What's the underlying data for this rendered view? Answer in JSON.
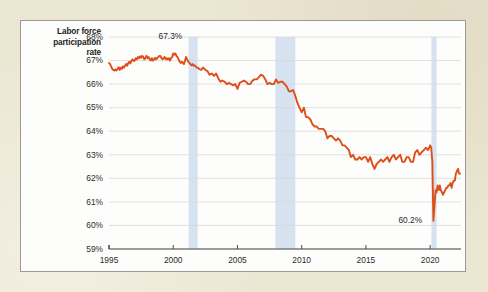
{
  "figure": {
    "background_color": "#ece7d3",
    "card_color": "#fdfdfb",
    "card_border_color": "#9a9a92",
    "line_color": "#dd4f1a",
    "recession_band_color": "#d6e2ef",
    "gridline_color": "#d9d9d9",
    "axis_color": "#4a4a4a"
  },
  "axis_title": {
    "line1": "Labor force",
    "line2": "participation",
    "line3": "rate"
  },
  "annotations": [
    {
      "id": "peak",
      "text": "67.3%",
      "year": 2000.1,
      "value": 67.3
    },
    {
      "id": "trough",
      "text": "60.2%",
      "year": 2020.33,
      "value": 60.2
    }
  ],
  "chart_data": {
    "type": "line",
    "title": "",
    "subtitle": "",
    "xlabel": "",
    "ylabel": "Labor force participation rate",
    "xlim": [
      1995,
      2022.4
    ],
    "ylim": [
      59,
      68
    ],
    "grid": true,
    "legend": null,
    "y_tick_labels": [
      "59%",
      "60%",
      "61%",
      "62%",
      "63%",
      "64%",
      "65%",
      "66%",
      "67%",
      "68%"
    ],
    "y_ticks": [
      59,
      60,
      61,
      62,
      63,
      64,
      65,
      66,
      67,
      68
    ],
    "x_tick_labels": [
      "1995",
      "2000",
      "2005",
      "2010",
      "2015",
      "2020"
    ],
    "x_ticks": [
      1995,
      2000,
      2005,
      2010,
      2015,
      2020
    ],
    "series": [
      {
        "name": "Labor force participation rate",
        "color": "#dd4f1a",
        "x": [
          1995.0,
          1995.08,
          1995.17,
          1995.25,
          1995.33,
          1995.42,
          1995.5,
          1995.58,
          1995.67,
          1995.75,
          1995.83,
          1995.92,
          1996.0,
          1996.08,
          1996.17,
          1996.25,
          1996.33,
          1996.42,
          1996.5,
          1996.58,
          1996.67,
          1996.75,
          1996.83,
          1996.92,
          1997.0,
          1997.08,
          1997.17,
          1997.25,
          1997.33,
          1997.42,
          1997.5,
          1997.58,
          1997.67,
          1997.75,
          1997.83,
          1997.92,
          1998.0,
          1998.08,
          1998.17,
          1998.25,
          1998.33,
          1998.42,
          1998.5,
          1998.58,
          1998.67,
          1998.75,
          1998.83,
          1998.92,
          1999.0,
          1999.08,
          1999.17,
          1999.25,
          1999.33,
          1999.42,
          1999.5,
          1999.58,
          1999.67,
          1999.75,
          1999.83,
          1999.92,
          2000.0,
          2000.08,
          2000.17,
          2000.25,
          2000.33,
          2000.42,
          2000.5,
          2000.58,
          2000.67,
          2000.75,
          2000.83,
          2000.92,
          2001.0,
          2001.08,
          2001.17,
          2001.25,
          2001.33,
          2001.42,
          2001.5,
          2001.58,
          2001.67,
          2001.75,
          2001.83,
          2001.92,
          2002.0,
          2002.17,
          2002.33,
          2002.5,
          2002.67,
          2002.83,
          2003.0,
          2003.17,
          2003.33,
          2003.5,
          2003.67,
          2003.83,
          2004.0,
          2004.17,
          2004.33,
          2004.5,
          2004.67,
          2004.83,
          2005.0,
          2005.17,
          2005.33,
          2005.5,
          2005.67,
          2005.83,
          2006.0,
          2006.17,
          2006.33,
          2006.5,
          2006.67,
          2006.83,
          2007.0,
          2007.17,
          2007.33,
          2007.5,
          2007.67,
          2007.83,
          2008.0,
          2008.17,
          2008.33,
          2008.5,
          2008.67,
          2008.83,
          2009.0,
          2009.17,
          2009.33,
          2009.5,
          2009.67,
          2009.83,
          2010.0,
          2010.17,
          2010.33,
          2010.5,
          2010.67,
          2010.83,
          2011.0,
          2011.17,
          2011.33,
          2011.5,
          2011.67,
          2011.83,
          2012.0,
          2012.17,
          2012.33,
          2012.5,
          2012.67,
          2012.83,
          2013.0,
          2013.17,
          2013.33,
          2013.5,
          2013.67,
          2013.83,
          2014.0,
          2014.17,
          2014.33,
          2014.5,
          2014.67,
          2014.83,
          2015.0,
          2015.17,
          2015.33,
          2015.5,
          2015.67,
          2015.83,
          2016.0,
          2016.17,
          2016.33,
          2016.5,
          2016.67,
          2016.83,
          2017.0,
          2017.17,
          2017.33,
          2017.5,
          2017.67,
          2017.83,
          2018.0,
          2018.17,
          2018.33,
          2018.5,
          2018.67,
          2018.83,
          2019.0,
          2019.17,
          2019.33,
          2019.5,
          2019.67,
          2019.83,
          2020.0,
          2020.08,
          2020.17,
          2020.25,
          2020.33,
          2020.42,
          2020.5,
          2020.58,
          2020.67,
          2020.75,
          2020.83,
          2020.92,
          2021.0,
          2021.08,
          2021.17,
          2021.25,
          2021.33,
          2021.42,
          2021.5,
          2021.58,
          2021.67,
          2021.75,
          2021.83,
          2021.92,
          2022.0,
          2022.08,
          2022.17,
          2022.25,
          2022.33
        ],
        "y": [
          66.9,
          66.85,
          66.75,
          66.65,
          66.6,
          66.58,
          66.62,
          66.58,
          66.65,
          66.72,
          66.6,
          66.7,
          66.65,
          66.75,
          66.7,
          66.78,
          66.85,
          66.78,
          66.9,
          66.95,
          66.88,
          67.0,
          67.05,
          66.98,
          67.0,
          67.1,
          67.05,
          67.15,
          67.1,
          67.18,
          67.12,
          67.2,
          67.15,
          67.05,
          67.1,
          67.2,
          67.1,
          67.15,
          67.05,
          67.0,
          67.1,
          67.0,
          67.05,
          67.12,
          67.05,
          67.1,
          67.15,
          67.2,
          67.2,
          67.1,
          67.05,
          67.1,
          67.15,
          67.05,
          67.1,
          67.05,
          67.1,
          67.0,
          67.1,
          67.15,
          67.3,
          67.25,
          67.3,
          67.2,
          67.15,
          67.05,
          66.95,
          66.9,
          66.95,
          66.9,
          66.85,
          67.0,
          67.15,
          67.05,
          66.95,
          66.9,
          66.85,
          66.8,
          66.85,
          66.78,
          66.8,
          66.75,
          66.7,
          66.7,
          66.65,
          66.6,
          66.7,
          66.6,
          66.55,
          66.4,
          66.45,
          66.35,
          66.45,
          66.25,
          66.1,
          66.15,
          66.1,
          66.0,
          66.05,
          66.0,
          65.95,
          66.0,
          65.8,
          66.05,
          66.1,
          66.15,
          66.1,
          66.0,
          66.0,
          66.15,
          66.2,
          66.2,
          66.3,
          66.4,
          66.35,
          66.2,
          66.0,
          66.05,
          66.0,
          66.0,
          66.2,
          66.05,
          66.1,
          66.1,
          66.0,
          65.9,
          65.7,
          65.7,
          65.75,
          65.5,
          65.2,
          65.0,
          64.8,
          65.0,
          64.6,
          64.6,
          64.5,
          64.3,
          64.2,
          64.2,
          64.1,
          64.1,
          64.1,
          64.0,
          63.7,
          63.8,
          63.8,
          63.7,
          63.6,
          63.7,
          63.6,
          63.4,
          63.4,
          63.3,
          63.2,
          62.9,
          63.0,
          62.8,
          62.8,
          62.9,
          62.8,
          62.9,
          62.9,
          62.7,
          62.9,
          62.6,
          62.4,
          62.6,
          62.7,
          62.8,
          62.7,
          62.8,
          62.9,
          62.7,
          62.9,
          63.0,
          62.8,
          62.9,
          63.0,
          62.7,
          62.7,
          62.9,
          62.9,
          62.7,
          62.7,
          63.1,
          63.2,
          63.0,
          63.1,
          63.2,
          63.3,
          63.2,
          63.4,
          63.3,
          62.7,
          60.2,
          60.8,
          61.5,
          61.4,
          61.7,
          61.5,
          61.7,
          61.5,
          61.4,
          61.3,
          61.4,
          61.5,
          61.6,
          61.6,
          61.7,
          61.7,
          61.8,
          61.6,
          61.8,
          61.9,
          61.9,
          62.2,
          62.3,
          62.4,
          62.2,
          62.2
        ]
      }
    ],
    "shaded_regions": [
      {
        "label": "2001 recession",
        "start": 2001.2,
        "end": 2001.9,
        "color": "#d6e2ef"
      },
      {
        "label": "Great Recession",
        "start": 2007.95,
        "end": 2009.5,
        "color": "#d6e2ef"
      },
      {
        "label": "COVID-19 recession",
        "start": 2020.1,
        "end": 2020.5,
        "color": "#d6e2ef"
      }
    ]
  }
}
